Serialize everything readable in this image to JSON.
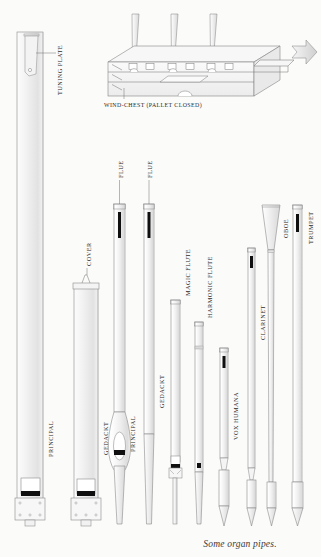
{
  "figure": {
    "caption": "Some organ pipes.",
    "background_color": "#fbfbfa",
    "line_color": "#8a8a8a",
    "text_color": "#2b2b2b"
  },
  "windchest": {
    "label": "WIND-CHEST (PALLET CLOSED)",
    "pipe_count": 3,
    "has_airflow_arrow": true
  },
  "callouts": [
    {
      "id": "tuning-plate",
      "label": "TUNING PLATE"
    },
    {
      "id": "cover",
      "label": "COVER"
    },
    {
      "id": "flue-1",
      "label": "FLUE"
    },
    {
      "id": "flue-2",
      "label": "FLUE"
    }
  ],
  "pipes": [
    {
      "id": "principal-large",
      "label": "PRINCIPAL",
      "type": "flue",
      "shape": "rectangular-wood"
    },
    {
      "id": "gedackt-large",
      "label": "GEDACKT",
      "type": "flue",
      "shape": "rectangular-wood-stopped"
    },
    {
      "id": "principal-metal",
      "label": "PRINCIPAL",
      "type": "flue",
      "shape": "spindle"
    },
    {
      "id": "gedackt-metal",
      "label": "GEDACKT",
      "type": "flue",
      "shape": "cylindrical-stopped"
    },
    {
      "id": "magic-flute",
      "label": "MAGIC FLUTE",
      "type": "flue",
      "shape": "cylindrical"
    },
    {
      "id": "harmonic-flute",
      "label": "HARMONIC FLUTE",
      "type": "flue",
      "shape": "cylindrical-tapered"
    },
    {
      "id": "vox-humana",
      "label": "VOX HUMANA",
      "type": "reed",
      "shape": "short-cylindrical"
    },
    {
      "id": "clarinet",
      "label": "CLARINET",
      "type": "reed",
      "shape": "narrow-cylindrical"
    },
    {
      "id": "oboe",
      "label": "OBOE",
      "type": "reed",
      "shape": "conical-flared-bell"
    },
    {
      "id": "trumpet",
      "label": "TRUMPET",
      "type": "reed",
      "shape": "conical"
    }
  ]
}
